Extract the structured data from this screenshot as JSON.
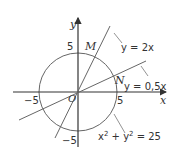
{
  "diagram": {
    "type": "coordinate-graph",
    "axes": {
      "x_label": "x",
      "y_label": "y",
      "origin_label": "O",
      "ticks": {
        "x_neg": "−5",
        "x_pos": "5",
        "y_pos": "5",
        "y_neg": "−5"
      }
    },
    "curves": [
      {
        "id": "circle",
        "equation": "x² + y² = 25",
        "label_base": "x",
        "label_mid": " + y",
        "label_end": " = 25"
      },
      {
        "id": "line1",
        "equation": "y = 2x",
        "label": "y = 2x"
      },
      {
        "id": "line2",
        "equation": "y = 0,5x",
        "label": "y = 0,5x"
      }
    ],
    "points": [
      {
        "name": "M",
        "label": "M"
      },
      {
        "name": "N",
        "label": "N"
      }
    ],
    "colors": {
      "stroke": "#555555",
      "text": "#333333"
    }
  }
}
